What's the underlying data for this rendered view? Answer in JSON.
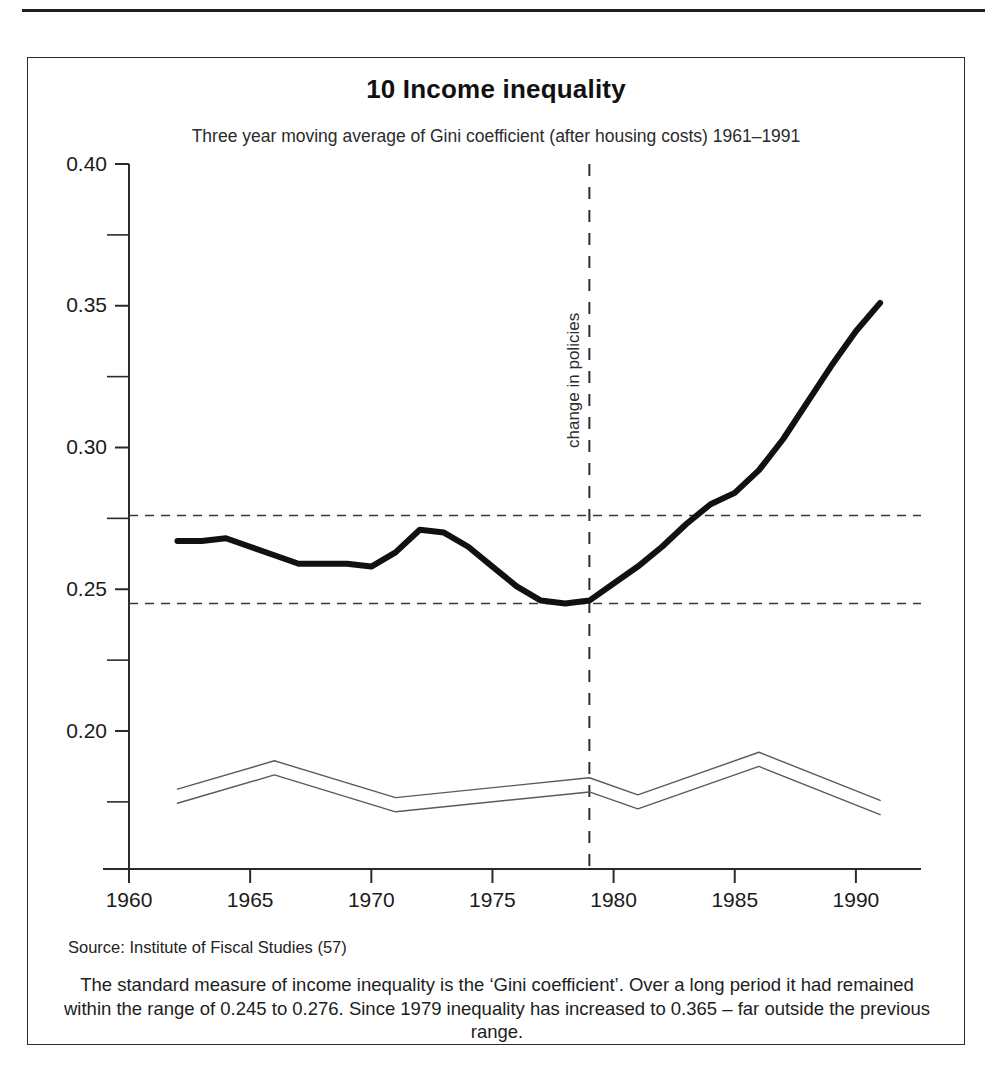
{
  "figure": {
    "number_title": "10 Income inequality",
    "subtitle": "Three year moving average of Gini coefficient (after housing costs) 1961–1991",
    "source": "Source: Institute of Fiscal Studies (57)",
    "caption": "The standard measure of income inequality is the ‘Gini coefficient’. Over a long period it had remained within the range of 0.245 to 0.276. Since 1979 inequality has increased to 0.365 – far outside the previous range.",
    "event_label": "change in policies"
  },
  "chart_data": {
    "type": "line",
    "title": "10 Income inequality",
    "subtitle": "Three year moving average of Gini coefficient (after housing costs) 1961–1991",
    "xlabel": "",
    "ylabel": "",
    "xlim": [
      1960,
      1992
    ],
    "ylim": [
      0.155,
      0.4
    ],
    "grid": false,
    "legend": "none",
    "x_ticks": [
      1960,
      1965,
      1970,
      1975,
      1980,
      1985,
      1990
    ],
    "x_tick_labels": [
      "1960",
      "1965",
      "1970",
      "1975",
      "1980",
      "1985",
      "1990"
    ],
    "y_ticks": [
      0.2,
      0.25,
      0.3,
      0.35,
      0.4
    ],
    "y_tick_labels": [
      "0.20",
      "0.25",
      "0.30",
      "0.35",
      "0.40"
    ],
    "y_minor_ticks": [
      0.175,
      0.225,
      0.275,
      0.325,
      0.375
    ],
    "reference_lines": [
      {
        "value": 0.276,
        "style": "dashed",
        "orientation": "horizontal",
        "label": "upper bound of long-run range"
      },
      {
        "value": 0.245,
        "style": "dashed",
        "orientation": "horizontal",
        "label": "lower bound of long-run range"
      },
      {
        "value": 1979,
        "style": "dashed",
        "orientation": "vertical",
        "label": "change in policies"
      }
    ],
    "series": [
      {
        "name": "Gini coefficient (after housing costs), 3-year moving average",
        "style": "thick-solid",
        "x": [
          1962,
          1963,
          1964,
          1965,
          1966,
          1967,
          1968,
          1969,
          1970,
          1971,
          1972,
          1973,
          1974,
          1975,
          1976,
          1977,
          1978,
          1979,
          1980,
          1981,
          1982,
          1983,
          1984,
          1985,
          1986,
          1987,
          1988,
          1989,
          1990,
          1991
        ],
        "values": [
          0.267,
          0.267,
          0.268,
          0.265,
          0.262,
          0.259,
          0.259,
          0.259,
          0.258,
          0.263,
          0.271,
          0.27,
          0.265,
          0.258,
          0.251,
          0.246,
          0.245,
          0.246,
          0.252,
          0.258,
          0.265,
          0.273,
          0.28,
          0.284,
          0.292,
          0.303,
          0.316,
          0.329,
          0.341,
          0.351
        ]
      },
      {
        "name": "Gini coefficient (before housing costs) upper line",
        "style": "thin-solid",
        "x": [
          1962,
          1966,
          1971,
          1979,
          1981,
          1986,
          1991
        ],
        "values": [
          0.1795,
          0.1895,
          0.1765,
          0.1835,
          0.1775,
          0.1925,
          0.1755
        ]
      },
      {
        "name": "Gini coefficient (before housing costs) lower line",
        "style": "thin-solid",
        "x": [
          1962,
          1966,
          1971,
          1979,
          1981,
          1986,
          1991
        ],
        "values": [
          0.1745,
          0.1845,
          0.1715,
          0.1785,
          0.1725,
          0.1875,
          0.1705
        ]
      }
    ],
    "annotations": [
      {
        "text": "change in policies",
        "x": 1979,
        "rotation": -90
      }
    ],
    "notable_values": {
      "range_low": 0.245,
      "range_high": 0.276,
      "policy_change_year": 1979,
      "final_value": 0.365
    }
  }
}
